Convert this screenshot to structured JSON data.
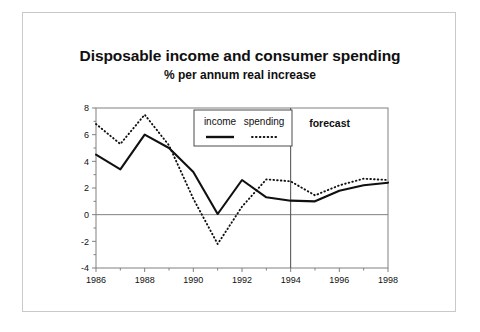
{
  "chart_data": {
    "type": "line",
    "title": "Disposable income and consumer spending",
    "subtitle": "% per annum real increase",
    "xlabel": "",
    "ylabel": "",
    "x": [
      1986,
      1987,
      1988,
      1989,
      1990,
      1991,
      1992,
      1993,
      1994,
      1995,
      1996,
      1997,
      1998
    ],
    "series": [
      {
        "name": "income",
        "style": "solid",
        "values": [
          4.5,
          3.4,
          6.0,
          5.0,
          3.2,
          0.05,
          2.6,
          1.3,
          1.05,
          1.0,
          1.8,
          2.2,
          2.4
        ]
      },
      {
        "name": "spending",
        "style": "dotted",
        "values": [
          6.8,
          5.3,
          7.5,
          5.2,
          1.2,
          -2.2,
          0.6,
          2.65,
          2.5,
          1.45,
          2.2,
          2.7,
          2.6
        ]
      }
    ],
    "xlim": [
      1986,
      1998
    ],
    "ylim": [
      -4,
      8
    ],
    "yticks": [
      8,
      6,
      4,
      2,
      0,
      -2,
      -4
    ],
    "ytick_labels": [
      "8",
      "6",
      "4",
      "2",
      "0",
      "-2",
      "-4"
    ],
    "xticks": [
      1986,
      1988,
      1990,
      1992,
      1994,
      1996,
      1998
    ],
    "xtick_labels": [
      "1986",
      "1988",
      "1990",
      "1992",
      "1994",
      "1996",
      "1998"
    ],
    "xminor_ticks": [
      1987,
      1989,
      1991,
      1993,
      1995,
      1997
    ],
    "grid": false,
    "zero_line": 0,
    "annotations": [
      {
        "name": "forecast",
        "text": "forecast",
        "x": 1995.6,
        "y": 6.6
      },
      {
        "name": "forecast-divider",
        "text": "",
        "x": 1994,
        "y": 0
      }
    ],
    "legend": {
      "position": "upper-center",
      "entries": [
        {
          "label": "income",
          "style": "solid"
        },
        {
          "label": "spending",
          "style": "dotted"
        }
      ]
    },
    "colors": {
      "line": "#101010",
      "axis": "#808080",
      "frame": "#808080",
      "outer_border": "#c9c9c9",
      "background": "#ffffff"
    }
  }
}
